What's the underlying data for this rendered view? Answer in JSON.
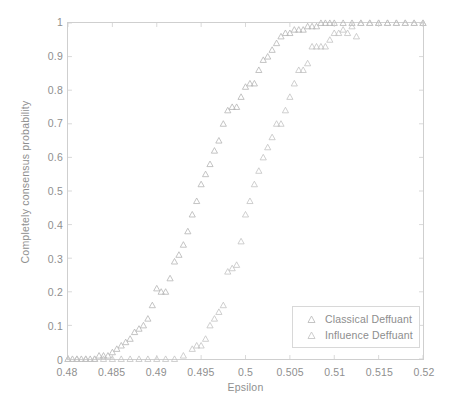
{
  "chart_data": {
    "type": "scatter",
    "title": "",
    "xlabel": "Epsilon",
    "ylabel": "Completely consensus probability",
    "xlim": [
      0.48,
      0.52
    ],
    "ylim": [
      0,
      1
    ],
    "xticks": [
      "0.48",
      "0.485",
      "0.49",
      "0.495",
      "0.5",
      "0.505",
      "0.51",
      "0.515",
      "0.52"
    ],
    "xtick_values": [
      0.48,
      0.485,
      0.49,
      0.495,
      0.5,
      0.505,
      0.51,
      0.515,
      0.52
    ],
    "yticks": [
      "0",
      "0.1",
      "0.2",
      "0.3",
      "0.4",
      "0.5",
      "0.6",
      "0.7",
      "0.8",
      "0.9",
      "1"
    ],
    "ytick_values": [
      0,
      0.1,
      0.2,
      0.3,
      0.4,
      0.5,
      0.6,
      0.7,
      0.8,
      0.9,
      1
    ],
    "grid": false,
    "legend_position": "lower-right",
    "marker": "triangle-up",
    "marker_color": "#b9b9b9",
    "axis_color": "#cfcfcf",
    "text_color": "#8f8f8f",
    "background": "#ffffff",
    "series": [
      {
        "name": "Classical Deffuant",
        "marker": "triangle-up",
        "color": "#b5b5b5",
        "points": [
          [
            0.48,
            0.0
          ],
          [
            0.4805,
            0.0
          ],
          [
            0.481,
            0.0
          ],
          [
            0.4815,
            0.0
          ],
          [
            0.482,
            0.0
          ],
          [
            0.4825,
            0.0
          ],
          [
            0.483,
            0.0
          ],
          [
            0.4835,
            0.01
          ],
          [
            0.484,
            0.01
          ],
          [
            0.4845,
            0.01
          ],
          [
            0.485,
            0.02
          ],
          [
            0.4855,
            0.03
          ],
          [
            0.486,
            0.04
          ],
          [
            0.4865,
            0.05
          ],
          [
            0.487,
            0.06
          ],
          [
            0.4875,
            0.08
          ],
          [
            0.488,
            0.09
          ],
          [
            0.4885,
            0.1
          ],
          [
            0.489,
            0.12
          ],
          [
            0.4895,
            0.16
          ],
          [
            0.49,
            0.21
          ],
          [
            0.4905,
            0.2
          ],
          [
            0.491,
            0.2
          ],
          [
            0.4915,
            0.24
          ],
          [
            0.492,
            0.29
          ],
          [
            0.4925,
            0.31
          ],
          [
            0.493,
            0.34
          ],
          [
            0.4935,
            0.38
          ],
          [
            0.494,
            0.43
          ],
          [
            0.4945,
            0.47
          ],
          [
            0.495,
            0.52
          ],
          [
            0.4955,
            0.55
          ],
          [
            0.496,
            0.58
          ],
          [
            0.4965,
            0.62
          ],
          [
            0.497,
            0.65
          ],
          [
            0.4975,
            0.7
          ],
          [
            0.498,
            0.74
          ],
          [
            0.4985,
            0.75
          ],
          [
            0.499,
            0.75
          ],
          [
            0.4995,
            0.78
          ],
          [
            0.5,
            0.81
          ],
          [
            0.5005,
            0.82
          ],
          [
            0.501,
            0.82
          ],
          [
            0.5015,
            0.86
          ],
          [
            0.502,
            0.89
          ],
          [
            0.5025,
            0.9
          ],
          [
            0.503,
            0.92
          ],
          [
            0.5035,
            0.94
          ],
          [
            0.504,
            0.96
          ],
          [
            0.5045,
            0.97
          ],
          [
            0.505,
            0.97
          ],
          [
            0.5055,
            0.98
          ],
          [
            0.506,
            0.98
          ],
          [
            0.5065,
            0.98
          ],
          [
            0.507,
            0.99
          ],
          [
            0.5075,
            0.99
          ],
          [
            0.508,
            0.99
          ],
          [
            0.5085,
            1.0
          ],
          [
            0.509,
            1.0
          ],
          [
            0.5095,
            1.0
          ],
          [
            0.51,
            1.0
          ],
          [
            0.511,
            1.0
          ],
          [
            0.512,
            1.0
          ],
          [
            0.513,
            1.0
          ],
          [
            0.514,
            1.0
          ],
          [
            0.515,
            1.0
          ],
          [
            0.516,
            1.0
          ],
          [
            0.517,
            1.0
          ],
          [
            0.518,
            1.0
          ],
          [
            0.519,
            1.0
          ],
          [
            0.52,
            1.0
          ]
        ]
      },
      {
        "name": "Influence Deffuant",
        "marker": "triangle-up",
        "color": "#c2c2c2",
        "points": [
          [
            0.48,
            0.0
          ],
          [
            0.481,
            0.0
          ],
          [
            0.482,
            0.0
          ],
          [
            0.483,
            0.0
          ],
          [
            0.484,
            0.0
          ],
          [
            0.485,
            0.0
          ],
          [
            0.486,
            0.0
          ],
          [
            0.487,
            0.0
          ],
          [
            0.488,
            0.0
          ],
          [
            0.489,
            0.0
          ],
          [
            0.49,
            0.0
          ],
          [
            0.491,
            0.0
          ],
          [
            0.492,
            0.0
          ],
          [
            0.493,
            0.01
          ],
          [
            0.494,
            0.03
          ],
          [
            0.4945,
            0.04
          ],
          [
            0.495,
            0.04
          ],
          [
            0.4955,
            0.06
          ],
          [
            0.496,
            0.1
          ],
          [
            0.4965,
            0.12
          ],
          [
            0.497,
            0.14
          ],
          [
            0.4975,
            0.16
          ],
          [
            0.498,
            0.26
          ],
          [
            0.4985,
            0.27
          ],
          [
            0.499,
            0.28
          ],
          [
            0.4995,
            0.35
          ],
          [
            0.5,
            0.43
          ],
          [
            0.5005,
            0.47
          ],
          [
            0.501,
            0.52
          ],
          [
            0.5015,
            0.56
          ],
          [
            0.502,
            0.6
          ],
          [
            0.5025,
            0.63
          ],
          [
            0.503,
            0.66
          ],
          [
            0.5035,
            0.7
          ],
          [
            0.504,
            0.7
          ],
          [
            0.5045,
            0.74
          ],
          [
            0.505,
            0.78
          ],
          [
            0.5055,
            0.82
          ],
          [
            0.506,
            0.86
          ],
          [
            0.5065,
            0.86
          ],
          [
            0.507,
            0.88
          ],
          [
            0.5075,
            0.93
          ],
          [
            0.508,
            0.93
          ],
          [
            0.5085,
            0.93
          ],
          [
            0.509,
            0.93
          ],
          [
            0.5095,
            0.95
          ],
          [
            0.51,
            0.97
          ],
          [
            0.5105,
            0.97
          ],
          [
            0.511,
            0.98
          ],
          [
            0.5115,
            0.97
          ],
          [
            0.512,
            0.99
          ],
          [
            0.5125,
            0.96
          ],
          [
            0.513,
            1.0
          ],
          [
            0.514,
            1.0
          ],
          [
            0.515,
            1.0
          ],
          [
            0.516,
            1.0
          ],
          [
            0.517,
            1.0
          ],
          [
            0.518,
            1.0
          ],
          [
            0.519,
            1.0
          ],
          [
            0.52,
            1.0
          ]
        ]
      }
    ]
  },
  "legend": {
    "entries": [
      {
        "label": "Classical Deffuant"
      },
      {
        "label": "Influence Deffuant"
      }
    ]
  }
}
